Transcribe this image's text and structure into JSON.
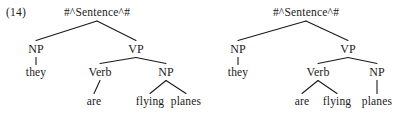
{
  "figure": {
    "example_number": "(14)",
    "caption": "",
    "ink_color": "#1a1a1a",
    "background_color": "#ffffff"
  },
  "trees": [
    {
      "id": "tree-left",
      "reading": "they are [flying planes]",
      "nodes": [
        {
          "id": "root",
          "label": "#^Sentence^#",
          "kind": "root",
          "x": 97,
          "y": 7
        },
        {
          "id": "np1",
          "label": "NP",
          "kind": "cat",
          "x": 36,
          "y": 43
        },
        {
          "id": "vp",
          "label": "VP",
          "kind": "cat",
          "x": 136,
          "y": 43
        },
        {
          "id": "they",
          "label": "they",
          "kind": "leaf",
          "x": 36,
          "y": 67
        },
        {
          "id": "verb",
          "label": "Verb",
          "kind": "cat",
          "x": 100,
          "y": 66
        },
        {
          "id": "np2",
          "label": "NP",
          "kind": "cat",
          "x": 166,
          "y": 66
        },
        {
          "id": "are",
          "label": "are",
          "kind": "leaf",
          "x": 94,
          "y": 96
        },
        {
          "id": "flying",
          "label": "flying",
          "kind": "leaf",
          "x": 150,
          "y": 96
        },
        {
          "id": "planes",
          "label": "planes",
          "kind": "leaf",
          "x": 186,
          "y": 96
        }
      ],
      "edges": [
        {
          "from": "root",
          "to": "np1"
        },
        {
          "from": "root",
          "to": "vp"
        },
        {
          "from": "np1",
          "to": "they"
        },
        {
          "from": "vp",
          "to": "verb"
        },
        {
          "from": "vp",
          "to": "np2"
        },
        {
          "from": "verb",
          "to": "are"
        },
        {
          "from": "np2",
          "to": "flying"
        },
        {
          "from": "np2",
          "to": "planes"
        }
      ]
    },
    {
      "id": "tree-right",
      "reading": "they [are flying] planes",
      "nodes": [
        {
          "id": "root",
          "label": "#^Sentence^#",
          "kind": "root",
          "x": 306,
          "y": 7
        },
        {
          "id": "np1",
          "label": "NP",
          "kind": "cat",
          "x": 238,
          "y": 43
        },
        {
          "id": "vp",
          "label": "VP",
          "kind": "cat",
          "x": 348,
          "y": 43
        },
        {
          "id": "they",
          "label": "they",
          "kind": "leaf",
          "x": 238,
          "y": 67
        },
        {
          "id": "verb",
          "label": "Verb",
          "kind": "cat",
          "x": 318,
          "y": 66
        },
        {
          "id": "np2",
          "label": "NP",
          "kind": "cat",
          "x": 377,
          "y": 66
        },
        {
          "id": "are",
          "label": "are",
          "kind": "leaf",
          "x": 302,
          "y": 96
        },
        {
          "id": "flying",
          "label": "flying",
          "kind": "leaf",
          "x": 337,
          "y": 96
        },
        {
          "id": "planes",
          "label": "planes",
          "kind": "leaf",
          "x": 377,
          "y": 96
        }
      ],
      "edges": [
        {
          "from": "root",
          "to": "np1"
        },
        {
          "from": "root",
          "to": "vp"
        },
        {
          "from": "np1",
          "to": "they"
        },
        {
          "from": "vp",
          "to": "verb"
        },
        {
          "from": "vp",
          "to": "np2"
        },
        {
          "from": "verb",
          "to": "are"
        },
        {
          "from": "verb",
          "to": "flying"
        },
        {
          "from": "np2",
          "to": "planes"
        }
      ]
    }
  ]
}
